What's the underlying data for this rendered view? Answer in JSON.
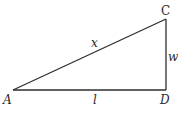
{
  "diagram": {
    "type": "right-triangle",
    "colors": {
      "stroke": "#2e2e2e",
      "text": "#2a2a2a",
      "background": "#ffffff"
    },
    "vertices": [
      {
        "id": "A",
        "label": "A",
        "x": 13,
        "y": 90
      },
      {
        "id": "C",
        "label": "C",
        "x": 166,
        "y": 19
      },
      {
        "id": "D",
        "label": "D",
        "x": 166,
        "y": 90
      }
    ],
    "edges": [
      {
        "from": "A",
        "to": "C",
        "label": "x"
      },
      {
        "from": "C",
        "to": "D",
        "label": "w"
      },
      {
        "from": "A",
        "to": "D",
        "label": "l"
      }
    ],
    "right_angle_at": "D"
  },
  "labels": {
    "A": "A",
    "C": "C",
    "D": "D",
    "x": "x",
    "w": "w",
    "l": "l"
  }
}
